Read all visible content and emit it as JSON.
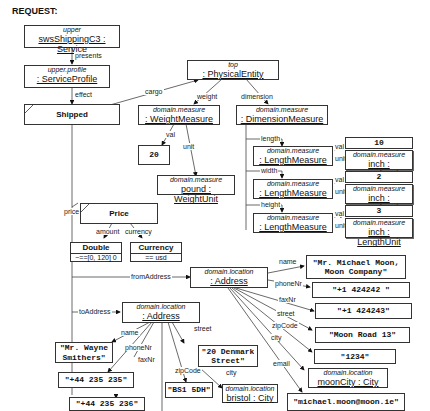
{
  "title": "REQUEST:",
  "service": {
    "stereotype": "upper",
    "name": "swsShippingC3 : Service"
  },
  "profile": {
    "stereotype": "upper.profile",
    "name": ": ServiceProfile"
  },
  "shipped": {
    "name": "Shipped"
  },
  "physical_entity": {
    "stereotype": "top",
    "name": ": PhysicalEntity"
  },
  "weight_measure": {
    "stereotype": "domain.measure",
    "name": ": WeightMeasure"
  },
  "weight_val": "20",
  "weight_unit": {
    "stereotype": "domain.measure",
    "name": "pound : WeightUnit"
  },
  "dimension_measure": {
    "stereotype": "domain.measure",
    "name": ": DimensionMeasure"
  },
  "lengths": [
    {
      "edge": "length",
      "stereotype": "domain.measure",
      "name": ": LengthMeasure",
      "val": "10",
      "unit_stereotype": "domain.measure",
      "unit": "inch : LengthUnit"
    },
    {
      "edge": "width",
      "stereotype": "domain.measure",
      "name": ": LengthMeasure",
      "val": "2",
      "unit_stereotype": "domain.measure",
      "unit": "inch : LengthUnit"
    },
    {
      "edge": "height",
      "stereotype": "domain.measure",
      "name": ": LengthMeasure",
      "val": "3",
      "unit_stereotype": "domain.measure",
      "unit": "inch : LengthUnit"
    }
  ],
  "price": {
    "name": "Price",
    "amount_type": "Double",
    "amount_constraint": "~==[0, 120] 0",
    "currency_type": "Currency",
    "currency_constraint": "== usd"
  },
  "from_address": {
    "stereotype": "domain.location",
    "name": ": Address",
    "name_val": "\"Mr. Michael Moon,\nMoon Company\"",
    "phone": "\"+1 424242 \"",
    "fax": "\"+1 424243\"",
    "street": "\"Moon Road 13\"",
    "zip": "\"1234\"",
    "city_stereotype": "domain.location",
    "city": "moonCity : City",
    "email": "\"michael.moon@moon.ie\""
  },
  "to_address": {
    "stereotype": "domain.location",
    "name": ": Address",
    "name_val": "\"Mr. Wayne\nSmithers\"",
    "phone": "\"+44 235 235\"",
    "fax": "\"+44 235 236\"",
    "street": "\"20 Denmark\nStreet\"",
    "zip": "\"BS1 5DH\"",
    "city_stereotype": "domain.location",
    "city": "bristol : City"
  },
  "edges": {
    "presents": "presents",
    "effect": "effect",
    "cargo": "cargo",
    "weight": "weight",
    "dimension": "dimension",
    "val": "val",
    "unit": "unit",
    "price": "price",
    "amount": "amount",
    "currency": "currency",
    "fromAddress": "fromAddress",
    "toAddress": "toAddress",
    "name": "name",
    "phoneNr": "phoneNr",
    "faxNr": "faxNr",
    "street": "street",
    "zipCode": "zipCode",
    "city": "city",
    "email": "email"
  }
}
